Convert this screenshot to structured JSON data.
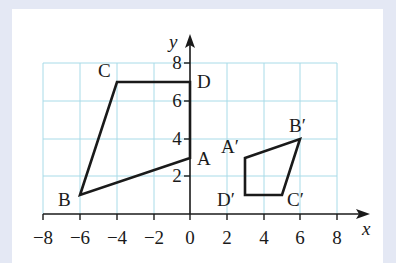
{
  "diagram": {
    "axes": {
      "x_label": "x",
      "y_label": "y",
      "x_ticks": [
        "−8",
        "−6",
        "−4",
        "−2",
        "0",
        "2",
        "4",
        "6",
        "8"
      ],
      "y_ticks": [
        "2",
        "4",
        "6",
        "8"
      ],
      "x_range": [
        -8,
        8
      ],
      "y_range": [
        0,
        8
      ],
      "grid_step": 2
    },
    "shapes": [
      {
        "name": "ABCD",
        "vertices": [
          {
            "label": "A",
            "x": 0,
            "y": 3
          },
          {
            "label": "B",
            "x": -6,
            "y": 1
          },
          {
            "label": "C",
            "x": -4,
            "y": 7
          },
          {
            "label": "D",
            "x": 0,
            "y": 7
          }
        ]
      },
      {
        "name": "A′B′C′D′",
        "vertices": [
          {
            "label": "A′",
            "x": 3,
            "y": 3
          },
          {
            "label": "B′",
            "x": 6,
            "y": 4
          },
          {
            "label": "C′",
            "x": 5,
            "y": 1
          },
          {
            "label": "D′",
            "x": 3,
            "y": 1
          }
        ]
      }
    ],
    "colors": {
      "background": "#e4e8f4",
      "panel": "#ffffff",
      "grid": "#a8dbe8",
      "ink": "#1a1a1a"
    }
  }
}
